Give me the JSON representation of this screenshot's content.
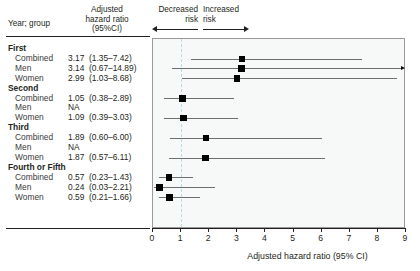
{
  "header": {
    "col_year_group": "Year; group",
    "col_hazard_ratio": "Adjusted\nhazard ratio\n(95%CI)",
    "decreased_risk": "Decreased\nrisk",
    "increased_risk": "Increased\nrisk",
    "decreased_arrow_icon": "left-arrow-icon",
    "increased_arrow_icon": "right-arrow-icon"
  },
  "axis": {
    "label": "Adjusted hazard ratio  (95% CI)",
    "ticks": [
      "0",
      "1",
      "2",
      "3",
      "4",
      "5",
      "6",
      "7",
      "8",
      "9"
    ],
    "min": 0,
    "max": 9,
    "reference_value": 1,
    "reference_color": "#b9dbe8"
  },
  "rows": [
    {
      "type": "group",
      "label": "First"
    },
    {
      "type": "data",
      "label": "Combined",
      "value": "3.17  (1.35–7.42)",
      "est": 3.17,
      "lo": 1.35,
      "hi": 7.42,
      "clipped": false
    },
    {
      "type": "data",
      "label": "Men",
      "value": "3.14  (0.67–14.89)",
      "est": 3.14,
      "lo": 0.67,
      "hi": 14.89,
      "clipped": true
    },
    {
      "type": "data",
      "label": "Women",
      "value": "2.99  (1.03–8.68)",
      "est": 2.99,
      "lo": 1.03,
      "hi": 8.68,
      "clipped": false
    },
    {
      "type": "group",
      "label": "Second"
    },
    {
      "type": "data",
      "label": "Combined",
      "value": "1.05  (0.38–2.89)",
      "est": 1.05,
      "lo": 0.38,
      "hi": 2.89,
      "clipped": false
    },
    {
      "type": "na",
      "label": "Men",
      "value": "NA"
    },
    {
      "type": "data",
      "label": "Women",
      "value": "1.09  (0.39–3.03)",
      "est": 1.09,
      "lo": 0.39,
      "hi": 3.03,
      "clipped": false
    },
    {
      "type": "group",
      "label": "Third"
    },
    {
      "type": "data",
      "label": "Combined",
      "value": "1.89  (0.60–6.00)",
      "est": 1.89,
      "lo": 0.6,
      "hi": 6.0,
      "clipped": false
    },
    {
      "type": "na",
      "label": "Men",
      "value": "NA"
    },
    {
      "type": "data",
      "label": "Women",
      "value": "1.87  (0.57–6.11)",
      "est": 1.87,
      "lo": 0.57,
      "hi": 6.11,
      "clipped": false
    },
    {
      "type": "group",
      "label": "Fourth or Fifth"
    },
    {
      "type": "data",
      "label": "Combined",
      "value": "0.57  (0.23–1.43)",
      "est": 0.57,
      "lo": 0.23,
      "hi": 1.43,
      "clipped": false
    },
    {
      "type": "data",
      "label": "Men",
      "value": "0.24  (0.03–2.21)",
      "est": 0.24,
      "lo": 0.03,
      "hi": 2.21,
      "clipped": false
    },
    {
      "type": "data",
      "label": "Women",
      "value": "0.59  (0.21–1.66)",
      "est": 0.59,
      "lo": 0.21,
      "hi": 1.66,
      "clipped": false
    }
  ],
  "chart_data": {
    "type": "scatter",
    "title": "",
    "xlabel": "Adjusted hazard ratio  (95% CI)",
    "ylabel": "Year; group",
    "xlim": [
      0,
      9
    ],
    "grid": false,
    "legend": null,
    "reference_line": 1,
    "annotations": [
      "Decreased risk",
      "Increased risk"
    ],
    "categories": [
      "First; Combined",
      "First; Men",
      "First; Women",
      "Second; Combined",
      "Second; Men",
      "Second; Women",
      "Third; Combined",
      "Third; Men",
      "Third; Women",
      "Fourth or Fifth; Combined",
      "Fourth or Fifth; Men",
      "Fourth or Fifth; Women"
    ],
    "values": [
      3.17,
      3.14,
      2.99,
      1.05,
      null,
      1.09,
      1.89,
      null,
      1.87,
      0.57,
      0.24,
      0.59
    ],
    "ci_lower": [
      1.35,
      0.67,
      1.03,
      0.38,
      null,
      0.39,
      0.6,
      null,
      0.57,
      0.23,
      0.03,
      0.21
    ],
    "ci_upper": [
      7.42,
      14.89,
      8.68,
      2.89,
      null,
      3.03,
      6.0,
      null,
      6.11,
      1.43,
      2.21,
      1.66
    ]
  }
}
